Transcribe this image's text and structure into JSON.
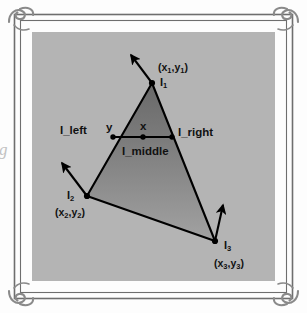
{
  "figure": {
    "type": "geometry-diagram",
    "panel": {
      "background_color": "#b4b4b4",
      "page_color": "#fdfdfd"
    },
    "frame": {
      "style": "double-rule-with-corner-flourishes",
      "line_color": "#6e6e6e",
      "ornament_color": "#8a8a8a",
      "ornament_name": "corner-flourish"
    },
    "triangle": {
      "fill_top_color": "#6f6f6f",
      "fill_bottom_color": "#a0a0a0",
      "stroke_color": "#000000"
    },
    "bleed_text": "g"
  },
  "vertices": [
    {
      "id": "v1",
      "label": "I",
      "sub": "1",
      "coord_open": "(x",
      "coord_sub1": "1",
      "coord_mid": ",y",
      "coord_sub2": "1",
      "coord_close": ")",
      "coord_text": "(x1,y1)",
      "x": 152,
      "y": 83,
      "normal_name": "vertex-normal-arrow-1"
    },
    {
      "id": "v2",
      "label": "I",
      "sub": "2",
      "coord_open": "(x",
      "coord_sub1": "2",
      "coord_mid": ",y",
      "coord_sub2": "2",
      "coord_close": ")",
      "coord_text": "(x2,y2)",
      "x": 87,
      "y": 196,
      "normal_name": "vertex-normal-arrow-2"
    },
    {
      "id": "v3",
      "label": "I",
      "sub": "3",
      "coord_open": "(x",
      "coord_sub1": "3",
      "coord_mid": ",y",
      "coord_sub2": "3",
      "coord_close": ")",
      "coord_text": "(x3,y3)",
      "x": 215,
      "y": 241,
      "normal_name": "vertex-normal-arrow-3"
    }
  ],
  "scanline": {
    "label_left": "I_left",
    "label_right": "I_right",
    "label_middle": "I_middle",
    "var_y": "y",
    "var_x": "x",
    "left_x": 113,
    "right_x": 172,
    "y": 137,
    "center_x": 143
  }
}
